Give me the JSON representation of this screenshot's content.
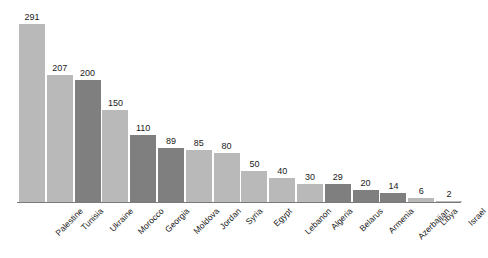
{
  "chart_data": {
    "type": "bar",
    "title": "",
    "subtitle": "",
    "xlabel": "",
    "ylabel": "",
    "ylim": [
      0,
      291
    ],
    "grid": false,
    "legend": "none",
    "orientation": "vertical",
    "categories": [
      "Palestine",
      "Tunisia",
      "Ukraine",
      "Morocco",
      "Georgia",
      "Moldova",
      "Jordan",
      "Syria",
      "Egypt",
      "Lebanon",
      "Algeria",
      "Belarus",
      "Armenia",
      "Azerbaijan",
      "Libya",
      "Israel"
    ],
    "values": [
      291,
      207,
      200,
      150,
      110,
      89,
      85,
      80,
      50,
      40,
      30,
      29,
      20,
      14,
      6,
      2
    ],
    "bar_shades": [
      "light",
      "light",
      "dark",
      "light",
      "dark",
      "dark",
      "light",
      "light",
      "light",
      "light",
      "light",
      "dark",
      "dark",
      "dark",
      "light",
      "light"
    ],
    "colors": {
      "light": "#b9b9b9",
      "dark": "#7f7f7f",
      "axis": "#7a7a7a",
      "text": "#1b1b1b",
      "background": "#ffffff"
    }
  }
}
